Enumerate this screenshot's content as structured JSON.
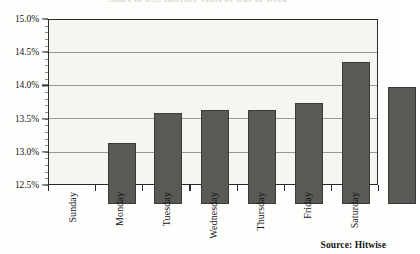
{
  "chart_data": {
    "type": "bar",
    "title": "Share of U.S. Internet Visits by Day of Week",
    "categories": [
      "Sunday",
      "Monday",
      "Tuesday",
      "Wednesday",
      "Thursday",
      "Friday",
      "Saturday"
    ],
    "values": [
      13.43,
      13.89,
      13.94,
      13.93,
      14.04,
      14.66,
      14.29
    ],
    "value_labels": [
      "13.43%",
      "13.89%",
      "13.94%",
      "13.93%",
      "14.04%",
      "14.66%",
      "14.29%"
    ],
    "xlabel": "",
    "ylabel": "",
    "ylim": [
      12.5,
      15.0
    ],
    "ytick_values": [
      15.0,
      14.5,
      14.0,
      13.5,
      13.0,
      12.5
    ],
    "ytick_labels": [
      "15.0%",
      "14.5%",
      "14.0%",
      "13.5%",
      "13.0%",
      "12.5%"
    ],
    "grid": true,
    "legend": false,
    "legend_position": "none",
    "series": [
      {
        "name": "Share of visits",
        "values": [
          13.43,
          13.89,
          13.94,
          13.93,
          14.04,
          14.66,
          14.29
        ]
      }
    ]
  },
  "colors": {
    "bar_fill": "#595955",
    "bar_border": "#3a3a36",
    "plot_background": "#f6f5f0",
    "axis_line": "#2b2b2b",
    "gridline": "#9a9a93",
    "text": "#151515",
    "page_background": "#fefefd"
  },
  "source_note": "Source: Hitwise"
}
